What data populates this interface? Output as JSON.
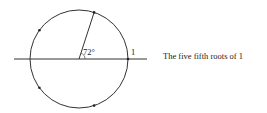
{
  "diagram": {
    "title": "The five fifth roots of 1",
    "angle_label": "72°",
    "unit_label": "1",
    "circle": {
      "cx": 79,
      "cy": 59,
      "r": 49
    },
    "axis": {
      "x1": 14,
      "x2": 147,
      "y": 59
    },
    "roots_count": 5,
    "angle_degrees": 72,
    "stroke_color": "#333333"
  }
}
